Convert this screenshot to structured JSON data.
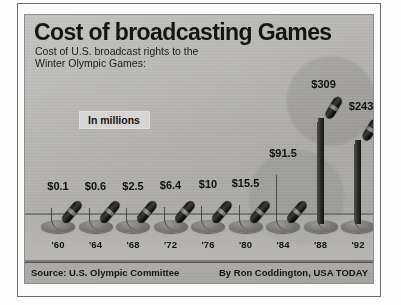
{
  "chart_data": {
    "type": "bar",
    "title": "Cost of broadcasting Games",
    "subtitle": "Cost of U.S. broadcast rights to the\nWinter Olympic Games:",
    "units_label": "In millions",
    "xlabel": "",
    "ylabel": "",
    "ylim": [
      0,
      309
    ],
    "grid": false,
    "legend": null,
    "categories": [
      "'60",
      "'64",
      "'68",
      "'72",
      "'76",
      "'80",
      "'84",
      "'88",
      "'92"
    ],
    "values": [
      0.1,
      0.6,
      2.5,
      6.4,
      10,
      15.5,
      91.5,
      309,
      243
    ],
    "value_labels": [
      "$0.1",
      "$0.6",
      "$2.5",
      "$6.4",
      "$10",
      "$15.5",
      "$91.5",
      "$309",
      "$243"
    ],
    "bars": [
      {
        "year": "'60",
        "value": 0.1,
        "label": "$0.1",
        "px_height": 20,
        "tall": false
      },
      {
        "year": "'64",
        "value": 0.6,
        "label": "$0.6",
        "px_height": 20,
        "tall": false
      },
      {
        "year": "'68",
        "value": 2.5,
        "label": "$2.5",
        "px_height": 20,
        "tall": false
      },
      {
        "year": "'72",
        "value": 6.4,
        "label": "$6.4",
        "px_height": 21,
        "tall": false
      },
      {
        "year": "'76",
        "value": 10,
        "label": "$10",
        "px_height": 22,
        "tall": false
      },
      {
        "year": "'80",
        "value": 15.5,
        "label": "$15.5",
        "px_height": 23,
        "tall": false
      },
      {
        "year": "'84",
        "value": 91.5,
        "label": "$91.5",
        "px_height": 53,
        "tall": false
      },
      {
        "year": "'88",
        "value": 309,
        "label": "$309",
        "px_height": 122,
        "tall": true
      },
      {
        "year": "'92",
        "value": 243,
        "label": "$243",
        "px_height": 100,
        "tall": true
      }
    ]
  },
  "footer": {
    "source": "Source: U.S. Olympic Committee",
    "credit": "By Ron Coddington, USA TODAY"
  },
  "colors": {
    "panel_bg": "#b9b8b5",
    "ink": "#121212",
    "mic_dark": "#141313",
    "tag_bg": "#d6d5d2"
  }
}
